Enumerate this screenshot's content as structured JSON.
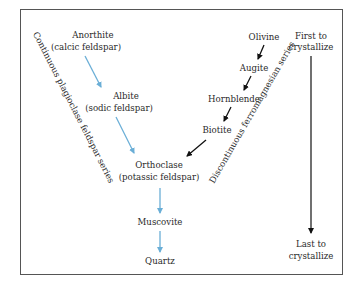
{
  "diagram": {
    "continuous_series": {
      "label": "Continuous plagioclase feldspar series",
      "arrow_color": "#6aaed6",
      "minerals": [
        {
          "name": "Anorthite",
          "note": "(calcic feldspar)"
        },
        {
          "name": "Albite",
          "note": "(sodic feldspar)"
        }
      ]
    },
    "discontinuous_series": {
      "label": "Discontinuous ferromagnesian series",
      "arrow_color": "#111111",
      "minerals": [
        {
          "name": "Olivine"
        },
        {
          "name": "Augite"
        },
        {
          "name": "Hornblende"
        },
        {
          "name": "Biotite"
        }
      ]
    },
    "merged": [
      {
        "name": "Orthoclase",
        "note": "(potassic feldspar)"
      },
      {
        "name": "Muscovite"
      },
      {
        "name": "Quartz"
      }
    ],
    "order_axis": {
      "top_label_line1": "First to",
      "top_label_line2": "crystallize",
      "bottom_label_line1": "Last to",
      "bottom_label_line2": "crystallize"
    }
  }
}
